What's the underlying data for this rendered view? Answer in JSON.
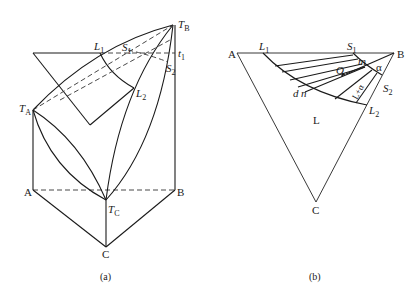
{
  "figure_a": {
    "caption": "(a)",
    "labels": {
      "TB": {
        "main": "T",
        "sub": "B"
      },
      "TA": {
        "main": "T",
        "sub": "A"
      },
      "TC": {
        "main": "T",
        "sub": "C"
      },
      "t1": {
        "main": "t",
        "sub": "1"
      },
      "L1": {
        "main": "L",
        "sub": "1"
      },
      "L2": {
        "main": "L",
        "sub": "2"
      },
      "S1": {
        "main": "S",
        "sub": "1"
      },
      "S2": {
        "main": "S",
        "sub": "2"
      },
      "A": "A",
      "B": "B",
      "C": "C"
    }
  },
  "figure_b": {
    "caption": "(b)",
    "labels": {
      "A": "A",
      "B": "B",
      "C": "C",
      "L1": {
        "main": "L",
        "sub": "1"
      },
      "L2": {
        "main": "L",
        "sub": "2"
      },
      "S1": {
        "main": "S",
        "sub": "1"
      },
      "S2": {
        "main": "S",
        "sub": "2"
      },
      "m": "m",
      "O": "O",
      "d": "d",
      "n": "n",
      "alpha": "α",
      "L_region": "L",
      "two_phase": "L+α"
    }
  }
}
